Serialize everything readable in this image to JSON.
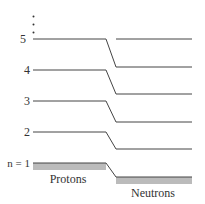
{
  "diagram": {
    "title": "",
    "level_labels": [
      "n = 1",
      "2",
      "3",
      "4",
      "5"
    ],
    "ellipsis": "⋮",
    "protons_label": "Protons",
    "neutrons_label": "Neutrons",
    "proton_levels_y": [
      163,
      132,
      101,
      70,
      39
    ],
    "neutron_levels_y": [
      177,
      149,
      122,
      94,
      67,
      39
    ],
    "colors": {
      "line": "#444444",
      "fill": "#bbbbbb",
      "text": "#333333"
    }
  }
}
